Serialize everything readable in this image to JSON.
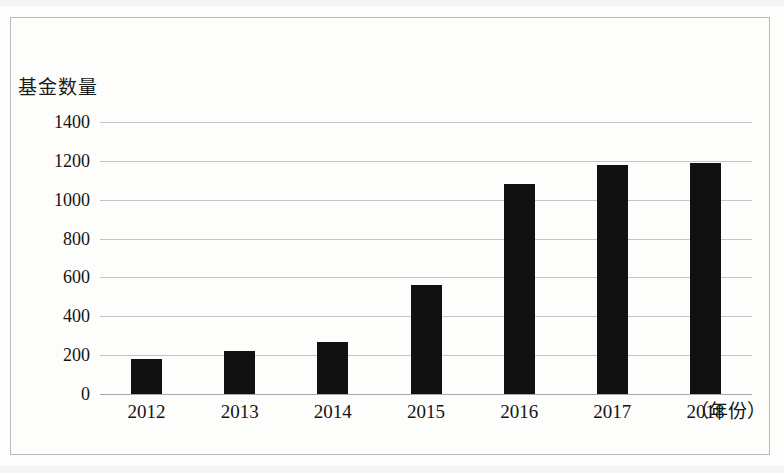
{
  "chart_data": {
    "type": "bar",
    "title": "",
    "subtitle": "",
    "ylabel": "基金数量",
    "xlabel": "（年份）",
    "categories": [
      "2012",
      "2013",
      "2014",
      "2015",
      "2016",
      "2017",
      "2018"
    ],
    "values": [
      180,
      220,
      270,
      560,
      1080,
      1180,
      1190
    ],
    "series": [
      {
        "name": "基金数量",
        "values": [
          180,
          220,
          270,
          560,
          1080,
          1180,
          1190
        ]
      }
    ],
    "ylim": [
      0,
      1400
    ],
    "ytick_labels": [
      "1400",
      "1200",
      "1000",
      "800",
      "600",
      "400",
      "200",
      "0"
    ],
    "ytick_values": [
      1400,
      1200,
      1000,
      800,
      600,
      400,
      200,
      0
    ],
    "ytick_step": 200,
    "grid": true,
    "grid_axis": "y",
    "legend": false,
    "legend_position": "none",
    "bar_color": "#111111",
    "gridline_color": "#c5c5c5",
    "annotations": []
  },
  "axis": {
    "y_title": "基金数量",
    "x_unit": "（年份）"
  }
}
